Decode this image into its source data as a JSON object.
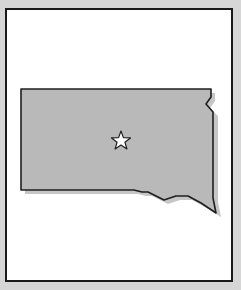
{
  "map": {
    "region": "South Dakota",
    "marker": {
      "type": "star",
      "meaning": "state capital",
      "x": 121,
      "y": 141
    },
    "colors": {
      "background": "#d6d6d6",
      "frame_fill": "#ffffff",
      "frame_border": "#1a1a1a",
      "state_fill": "#b9b9b9",
      "state_outline": "#1f1f1f",
      "shadow": "#c4c4c4",
      "marker_fill": "#ffffff"
    }
  }
}
